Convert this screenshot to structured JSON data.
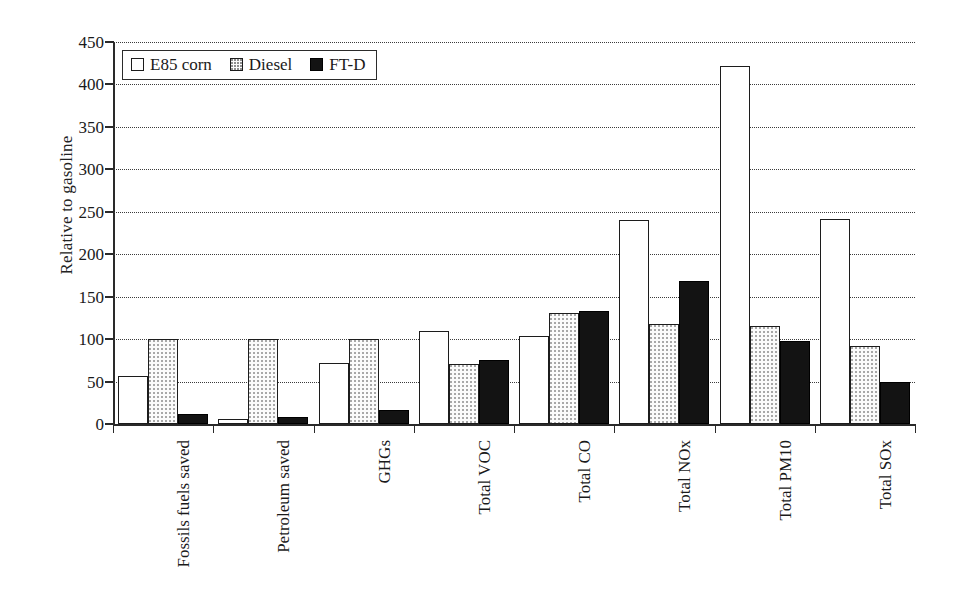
{
  "chart_data": {
    "type": "bar",
    "title": "",
    "xlabel": "",
    "ylabel": "Relative to gasoline",
    "ylim": [
      0,
      450
    ],
    "ytick_step": 50,
    "yticks": [
      450,
      400,
      350,
      300,
      250,
      200,
      150,
      100,
      50,
      0
    ],
    "grid": true,
    "grid_axis": "y",
    "legend_position": "top-left",
    "categories": [
      "Fossils fuels saved",
      "Petroleum saved",
      "GHGs",
      "Total VOC",
      "Total CO",
      "Total NOx",
      "Total PM10",
      "Total SOx"
    ],
    "series": [
      {
        "name": "E85 corn",
        "fill": "white",
        "values": [
          57,
          6,
          72,
          110,
          104,
          240,
          422,
          242
        ]
      },
      {
        "name": "Diesel",
        "fill": "dotted",
        "values": [
          100,
          100,
          100,
          71,
          131,
          118,
          115,
          92
        ]
      },
      {
        "name": "FT-D",
        "fill": "black",
        "values": [
          12,
          8,
          16,
          76,
          133,
          169,
          98,
          50
        ]
      }
    ]
  },
  "legend": {
    "items": [
      {
        "label": "E85 corn",
        "swatch": "white-square-icon"
      },
      {
        "label": "Diesel",
        "swatch": "dotted-square-icon"
      },
      {
        "label": "FT-D",
        "swatch": "black-square-icon"
      }
    ]
  },
  "axes": {
    "y_title": "Relative to gasoline"
  },
  "colors": {
    "axis": "#2a2a2a",
    "grid": "#3b3b3b",
    "series_e85": "#ffffff",
    "series_diesel": "#fbfbfb",
    "series_ftd": "#131313",
    "text": "#1a1a1a",
    "background": "#ffffff"
  }
}
